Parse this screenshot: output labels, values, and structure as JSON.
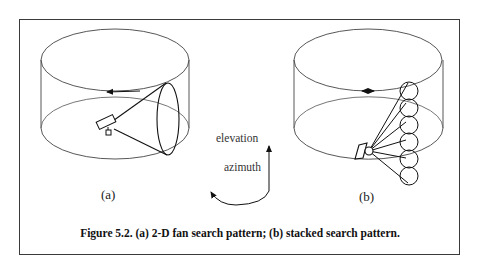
{
  "figure": {
    "caption": "Figure 5.2. (a) 2-D fan search pattern; (b) stacked search pattern.",
    "panels": [
      {
        "label": "(a)",
        "description": "2-D fan beam scanning in azimuth"
      },
      {
        "label": "(b)",
        "description": "stacked beams scanning in azimuth"
      }
    ],
    "axes_legend": {
      "elevation_label": "elevation",
      "azimuth_label": "azimuth"
    }
  }
}
